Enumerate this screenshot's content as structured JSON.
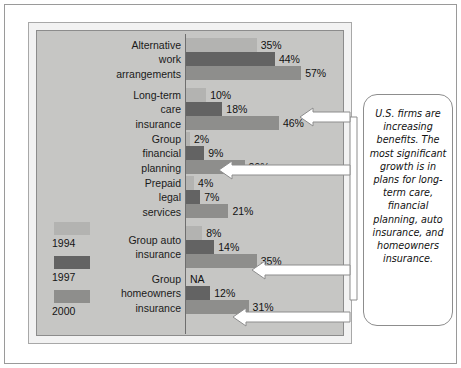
{
  "chart_data": {
    "type": "bar",
    "orientation": "horizontal",
    "title": "",
    "subtitle": "",
    "xlabel": "",
    "ylabel": "",
    "grid": false,
    "xlim": [
      0,
      60
    ],
    "value_suffix": "%",
    "legend_position": "left-bottom",
    "categories": [
      "Alternative work arrangements",
      "Long-term care insurance",
      "Group financial planning",
      "Prepaid legal services",
      "Group auto insurance",
      "Group homeowners insurance"
    ],
    "series": [
      {
        "name": "1994",
        "color": "#b3b3b1",
        "values": [
          35,
          10,
          2,
          4,
          8,
          null
        ],
        "labels": [
          "35%",
          "10%",
          "2%",
          "4%",
          "8%",
          "NA"
        ]
      },
      {
        "name": "1997",
        "color": "#636363",
        "values": [
          44,
          18,
          9,
          7,
          14,
          12
        ],
        "labels": [
          "44%",
          "18%",
          "9%",
          "7%",
          "14%",
          "12%"
        ]
      },
      {
        "name": "2000",
        "color": "#8e8e8c",
        "values": [
          57,
          46,
          29,
          21,
          35,
          31
        ],
        "labels": [
          "57%",
          "46%",
          "29%",
          "21%",
          "35%",
          "31%"
        ]
      }
    ]
  },
  "chart": {
    "groups": [
      {
        "label_lines": [
          "Alternative",
          "work",
          "arrangements"
        ],
        "bars": [
          {
            "series": "1994",
            "value": 35,
            "label": "35%"
          },
          {
            "series": "1997",
            "value": 44,
            "label": "44%"
          },
          {
            "series": "2000",
            "value": 57,
            "label": "57%"
          }
        ]
      },
      {
        "label_lines": [
          "Long-term",
          "care",
          "insurance"
        ],
        "bars": [
          {
            "series": "1994",
            "value": 10,
            "label": "10%"
          },
          {
            "series": "1997",
            "value": 18,
            "label": "18%"
          },
          {
            "series": "2000",
            "value": 46,
            "label": "46%"
          }
        ]
      },
      {
        "label_lines": [
          "Group",
          "financial",
          "planning"
        ],
        "bars": [
          {
            "series": "1994",
            "value": 2,
            "label": "2%"
          },
          {
            "series": "1997",
            "value": 9,
            "label": "9%"
          },
          {
            "series": "2000",
            "value": 29,
            "label": "29%"
          }
        ]
      },
      {
        "label_lines": [
          "Prepaid",
          "legal",
          "services"
        ],
        "bars": [
          {
            "series": "1994",
            "value": 4,
            "label": "4%"
          },
          {
            "series": "1997",
            "value": 7,
            "label": "7%"
          },
          {
            "series": "2000",
            "value": 21,
            "label": "21%"
          }
        ]
      },
      {
        "label_lines": [
          "Group auto",
          "insurance"
        ],
        "bars": [
          {
            "series": "1994",
            "value": 8,
            "label": "8%"
          },
          {
            "series": "1997",
            "value": 14,
            "label": "14%"
          },
          {
            "series": "2000",
            "value": 35,
            "label": "35%"
          }
        ]
      },
      {
        "label_lines": [
          "Group",
          "homeowners",
          "insurance"
        ],
        "bars": [
          {
            "series": "1994",
            "value": 0,
            "label": "NA"
          },
          {
            "series": "1997",
            "value": 12,
            "label": "12%"
          },
          {
            "series": "2000",
            "value": 31,
            "label": "31%"
          }
        ]
      }
    ]
  },
  "legend": {
    "items": [
      {
        "label": "1994",
        "color": "#b3b3b1"
      },
      {
        "label": "1997",
        "color": "#636363"
      },
      {
        "label": "2000",
        "color": "#8e8e8c"
      }
    ]
  },
  "callout": {
    "text": "U.S. firms are increasing benefits. The most significant growth is in plans for long-term care, financial planning, auto insurance, and homeowners insurance."
  }
}
